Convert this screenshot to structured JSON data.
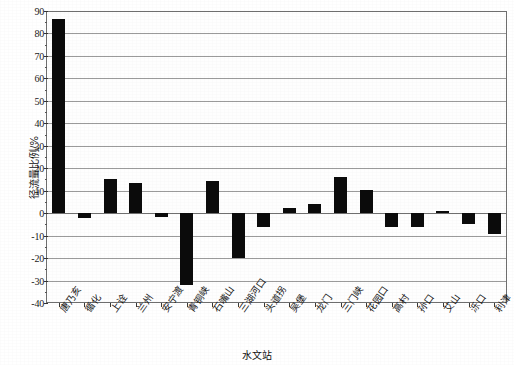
{
  "chart_data": {
    "type": "bar",
    "title": "",
    "xlabel": "水文站",
    "ylabel": "径流量比例/%",
    "ylim": [
      -40,
      90
    ],
    "ytick_step": 10,
    "yticks": [
      90,
      80,
      70,
      60,
      50,
      40,
      30,
      20,
      10,
      0,
      -10,
      -20,
      -30,
      -40
    ],
    "ytick_labels": [
      "90",
      "80",
      "70",
      "60",
      "50",
      "40",
      "30",
      "20",
      "10",
      "0",
      "-10",
      "-20",
      "-30",
      "-40"
    ],
    "grid": true,
    "grid_axis": "y",
    "legend": "none",
    "bar_color": "#0b0b0b",
    "categories": [
      "唐乃亥",
      "循化",
      "上诠",
      "兰州",
      "安宁渡",
      "青铜峡",
      "石嘴山",
      "三湖河口",
      "头道拐",
      "吴堡",
      "龙门",
      "三门峡",
      "花园口",
      "高村",
      "孙口",
      "艾山",
      "泺口",
      "利津"
    ],
    "values": [
      86.5,
      -2.0,
      15.0,
      13.5,
      -1.5,
      -32.0,
      14.5,
      -20.0,
      -6.0,
      2.5,
      4.0,
      16.0,
      10.5,
      -6.0,
      -6.0,
      1.0,
      -5.0,
      -9.5
    ],
    "series_name": "径流量比例"
  },
  "axis": {
    "y_title": "径流量比例/%",
    "x_title": "水文站"
  }
}
